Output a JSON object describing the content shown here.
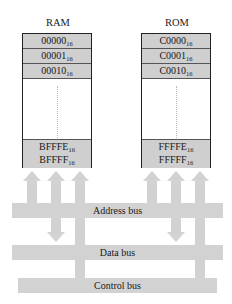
{
  "ram": {
    "title": "RAM",
    "rows_top": [
      {
        "value": "00000",
        "base": "16"
      },
      {
        "value": "00001",
        "base": "16"
      },
      {
        "value": "00010",
        "base": "16"
      }
    ],
    "rows_bottom": [
      {
        "value": "BFFFE",
        "base": "16"
      },
      {
        "value": "BFFFF",
        "base": "16"
      }
    ]
  },
  "rom": {
    "title": "ROM",
    "rows_top": [
      {
        "value": "C0000",
        "base": "16"
      },
      {
        "value": "C0001",
        "base": "16"
      },
      {
        "value": "C0010",
        "base": "16"
      }
    ],
    "rows_bottom": [
      {
        "value": "FFFFE",
        "base": "16"
      },
      {
        "value": "FFFFF",
        "base": "16"
      }
    ]
  },
  "buses": {
    "address": "Address bus",
    "data": "Data bus",
    "control": "Control bus"
  },
  "colors": {
    "bus_fill": "#d2d2d2",
    "cell_fill": "#cfcfcf",
    "border": "#222222"
  }
}
